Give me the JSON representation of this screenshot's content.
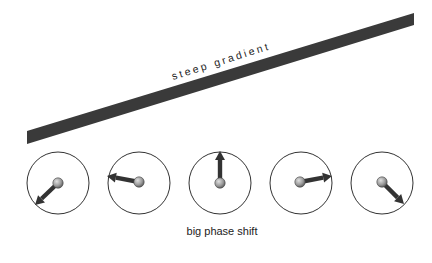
{
  "diagram": {
    "gradient_bar": {
      "label": "steep gradient",
      "color": "#3a3a3a",
      "polygon": [
        [
          27,
          131
        ],
        [
          414,
          13
        ],
        [
          414,
          25
        ],
        [
          27,
          144
        ]
      ]
    },
    "gradient_label_pos": {
      "x": 173,
      "y": 80,
      "angle": -17.5
    },
    "caption": "big phase shift",
    "caption_pos": {
      "x": 222,
      "y": 235
    },
    "phasors": [
      {
        "cx": 58,
        "cy": 183,
        "r": 31,
        "ball": [
          58,
          183
        ],
        "tip": [
          35,
          205
        ]
      },
      {
        "cx": 139,
        "cy": 183,
        "r": 31,
        "ball": [
          139,
          182
        ],
        "tip": [
          107,
          176
        ]
      },
      {
        "cx": 220,
        "cy": 183,
        "r": 31,
        "ball": [
          220,
          183
        ],
        "tip": [
          220,
          151
        ]
      },
      {
        "cx": 301,
        "cy": 183,
        "r": 31,
        "ball": [
          300,
          182
        ],
        "tip": [
          332,
          176
        ]
      },
      {
        "cx": 382,
        "cy": 183,
        "r": 31,
        "ball": [
          382,
          182
        ],
        "tip": [
          404,
          204
        ]
      }
    ],
    "colors": {
      "circle_stroke": "#333333",
      "arrow": "#333333",
      "ball": "#9a9a9a",
      "ball_highlight": "#d8d8d8"
    }
  }
}
